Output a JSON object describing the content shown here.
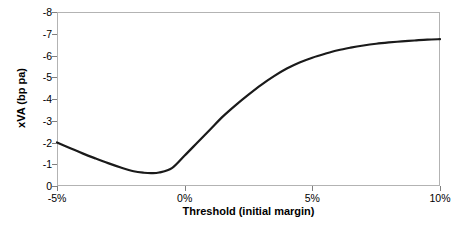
{
  "chart_data": {
    "type": "line",
    "title": "",
    "xlabel": "Threshold (initial margin)",
    "ylabel": "xVA (bp pa)",
    "xlim": [
      -5,
      10
    ],
    "ylim": [
      0,
      -8
    ],
    "y_inverted": true,
    "grid": false,
    "legend": "none",
    "x_ticks": [
      "-5%",
      "0%",
      "5%",
      "10%"
    ],
    "x_tick_values": [
      -5,
      0,
      5,
      10
    ],
    "y_ticks": [
      "-8",
      "-7",
      "-6",
      "-5",
      "-4",
      "-3",
      "-2",
      "-1",
      "0"
    ],
    "y_tick_values": [
      -8,
      -7,
      -6,
      -5,
      -4,
      -3,
      -2,
      -1,
      0
    ],
    "series": [
      {
        "name": "xVA",
        "color": "#1a1a1a",
        "line_width": 2.2,
        "x": [
          -5.0,
          -4.5,
          -4.0,
          -3.5,
          -3.0,
          -2.5,
          -2.0,
          -1.6,
          -1.3,
          -1.0,
          -0.5,
          0.0,
          0.5,
          1.0,
          1.5,
          2.0,
          2.5,
          3.0,
          3.5,
          4.0,
          4.5,
          5.0,
          5.5,
          6.0,
          6.5,
          7.0,
          7.5,
          8.0,
          8.5,
          9.0,
          9.5,
          10.0
        ],
        "y": [
          -2.0,
          -1.75,
          -1.5,
          -1.27,
          -1.05,
          -0.85,
          -0.68,
          -0.61,
          -0.59,
          -0.62,
          -0.82,
          -1.4,
          -2.0,
          -2.6,
          -3.2,
          -3.72,
          -4.2,
          -4.65,
          -5.05,
          -5.4,
          -5.68,
          -5.9,
          -6.08,
          -6.24,
          -6.36,
          -6.46,
          -6.54,
          -6.6,
          -6.65,
          -6.69,
          -6.73,
          -6.75
        ]
      }
    ]
  },
  "axes": {
    "y_title": "xVA (bp pa)",
    "x_title": "Threshold (initial margin)"
  }
}
